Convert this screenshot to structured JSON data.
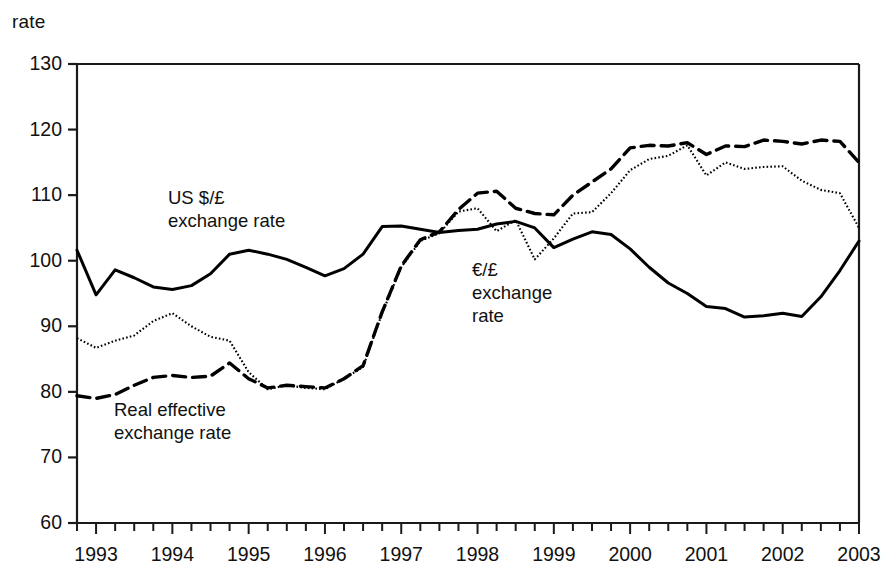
{
  "figure": {
    "unit_label": "rate",
    "clipped_title_fragment": "",
    "background_color": "#ffffff",
    "line_color": "#000000"
  },
  "chart_data": {
    "type": "line",
    "title": "",
    "xlabel": "",
    "ylabel": "rate",
    "ylim": [
      60,
      130
    ],
    "xlim": [
      1992.75,
      2003.0
    ],
    "ytick_labels": [
      "130",
      "120",
      "110",
      "100",
      "90",
      "80",
      "70",
      "60"
    ],
    "yticks": [
      130,
      120,
      110,
      100,
      90,
      80,
      70,
      60
    ],
    "xtick_labels": [
      "1993",
      "1994",
      "1995",
      "1996",
      "1997",
      "1998",
      "1999",
      "2000",
      "2001",
      "2002",
      "2003"
    ],
    "xticks": [
      1993,
      1994,
      1995,
      1996,
      1997,
      1998,
      1999,
      2000,
      2001,
      2002,
      2003
    ],
    "minor_tick_interval_years": 0.25,
    "grid": false,
    "legend_position": "inline-annotations",
    "annotations": [
      {
        "id": "usd",
        "text": "US $/£\nexchange rate",
        "x_px": 168,
        "y_px": 186
      },
      {
        "id": "eur",
        "text": "€/£\nexchange\nrate",
        "x_px": 472,
        "y_px": 258
      },
      {
        "id": "reer",
        "text": "Real effective\nexchange rate",
        "x_px": 114,
        "y_px": 398
      }
    ],
    "series": [
      {
        "name": "US $/£ exchange rate",
        "style": "solid",
        "x": [
          1992.75,
          1993.0,
          1993.25,
          1993.5,
          1993.75,
          1994.0,
          1994.25,
          1994.5,
          1994.75,
          1995.0,
          1995.25,
          1995.5,
          1995.75,
          1996.0,
          1996.25,
          1996.5,
          1996.75,
          1997.0,
          1997.25,
          1997.5,
          1997.75,
          1998.0,
          1998.25,
          1998.5,
          1998.75,
          1999.0,
          1999.25,
          1999.5,
          1999.75,
          2000.0,
          2000.25,
          2000.5,
          2000.75,
          2001.0,
          2001.25,
          2001.5,
          2001.75,
          2002.0,
          2002.25,
          2002.5,
          2002.75,
          2003.0
        ],
        "values": [
          101.6,
          94.8,
          98.6,
          97.4,
          96.0,
          95.6,
          96.2,
          98.0,
          101.0,
          101.6,
          101.0,
          100.2,
          99.0,
          97.7,
          98.8,
          101.0,
          105.2,
          105.3,
          104.8,
          104.3,
          104.6,
          104.8,
          105.6,
          106.0,
          105.0,
          102.0,
          103.3,
          104.4,
          104.0,
          101.8,
          99.0,
          96.6,
          95.0,
          93.0,
          92.7,
          91.4,
          91.6,
          92.0,
          91.5,
          94.5,
          98.5,
          103.0
        ]
      },
      {
        "name": "€/£ exchange rate",
        "style": "dotted",
        "x": [
          1992.75,
          1993.0,
          1993.25,
          1993.5,
          1993.75,
          1994.0,
          1994.25,
          1994.5,
          1994.75,
          1995.0,
          1995.25,
          1995.5,
          1995.75,
          1996.0,
          1996.25,
          1996.5,
          1996.75,
          1997.0,
          1997.25,
          1997.5,
          1997.75,
          1998.0,
          1998.25,
          1998.5,
          1998.75,
          1999.0,
          1999.25,
          1999.5,
          1999.75,
          2000.0,
          2000.25,
          2000.5,
          2000.75,
          2001.0,
          2001.25,
          2001.5,
          2001.75,
          2002.0,
          2002.25,
          2002.5,
          2002.75,
          2003.0
        ],
        "values": [
          88.2,
          86.7,
          87.8,
          88.6,
          90.8,
          92.0,
          90.0,
          88.4,
          87.8,
          83.0,
          80.4,
          81.0,
          80.6,
          80.4,
          82.0,
          83.8,
          92.0,
          99.0,
          103.0,
          104.2,
          107.5,
          108.0,
          104.5,
          106.2,
          100.2,
          103.4,
          107.2,
          107.4,
          110.3,
          113.8,
          115.5,
          116.0,
          117.6,
          113.0,
          115.0,
          114.0,
          114.3,
          114.4,
          112.2,
          110.8,
          110.3,
          105.0
        ]
      },
      {
        "name": "Real effective exchange rate",
        "style": "dashed",
        "x": [
          1992.75,
          1993.0,
          1993.25,
          1993.5,
          1993.75,
          1994.0,
          1994.25,
          1994.5,
          1994.75,
          1995.0,
          1995.25,
          1995.5,
          1995.75,
          1996.0,
          1996.25,
          1996.5,
          1996.75,
          1997.0,
          1997.25,
          1997.5,
          1997.75,
          1998.0,
          1998.25,
          1998.5,
          1998.75,
          1999.0,
          1999.25,
          1999.5,
          1999.75,
          2000.0,
          2000.25,
          2000.5,
          2000.75,
          2001.0,
          2001.25,
          2001.5,
          2001.75,
          2002.0,
          2002.25,
          2002.5,
          2002.75,
          2003.0
        ],
        "values": [
          79.4,
          79.0,
          79.6,
          81.0,
          82.2,
          82.5,
          82.2,
          82.4,
          84.4,
          82.0,
          80.6,
          81.0,
          80.8,
          80.6,
          82.0,
          84.0,
          92.2,
          99.2,
          103.2,
          104.4,
          107.8,
          110.3,
          110.6,
          108.0,
          107.2,
          107.0,
          110.0,
          112.0,
          114.0,
          117.2,
          117.6,
          117.5,
          118.0,
          116.2,
          117.5,
          117.4,
          118.4,
          118.2,
          117.8,
          118.4,
          118.2,
          115.0
        ]
      }
    ]
  }
}
